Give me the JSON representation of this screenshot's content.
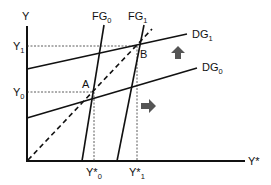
{
  "diagram": {
    "title": "",
    "axes": {
      "y_label": "Y",
      "x_label": "Y*"
    },
    "y_ticks": [
      {
        "main": "Y",
        "sub": "1",
        "y": 46
      },
      {
        "main": "Y",
        "sub": "0",
        "y": 92
      }
    ],
    "x_ticks": [
      {
        "main": "Y*",
        "sub": "0",
        "x": 94
      },
      {
        "main": "Y*",
        "sub": "1",
        "x": 137
      }
    ],
    "curves": [
      {
        "name": "FG",
        "sub": "0",
        "type": "solid"
      },
      {
        "name": "FG",
        "sub": "1",
        "type": "solid"
      },
      {
        "name": "DG",
        "sub": "1",
        "type": "solid"
      },
      {
        "name": "DG",
        "sub": "0",
        "type": "solid"
      },
      {
        "name": "45-degree line",
        "type": "dashed"
      }
    ],
    "points": [
      {
        "label": "A"
      },
      {
        "label": "B"
      }
    ],
    "arrows": [
      {
        "direction": "up",
        "meaning": "DG shift upward"
      },
      {
        "direction": "right",
        "meaning": "FG shift rightward"
      }
    ],
    "colors": {
      "line": "#111111",
      "arrow": "#555555",
      "guide": "#333333"
    }
  }
}
